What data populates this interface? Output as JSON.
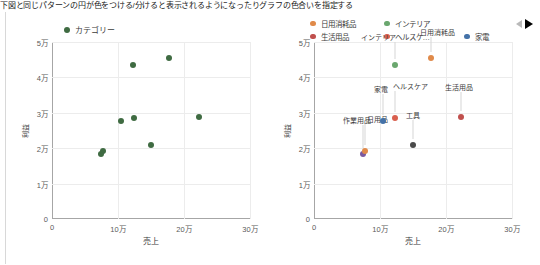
{
  "top_caption": "下図と同じパターンの円が色をつける/分けると表示されるようになったりグラフの色合いを指定する",
  "colors": {
    "series_green": "#3f6b42",
    "orange": "#e08a4a",
    "green": "#6aa76e",
    "red": "#c0504d",
    "red_orange": "#d9604f",
    "blue": "#4472a8",
    "gridline": "#ececec",
    "axis": "#a6a6a6",
    "text": "#3b3b3b"
  },
  "left_chart": {
    "legend": [
      {
        "label": "カテゴリー",
        "color": "#3f6b42",
        "icon": "legend-dot-icon"
      }
    ]
  },
  "right_chart": {
    "legend": [
      {
        "label": "日用消耗品",
        "color": "#e08a4a",
        "icon": "legend-dot-icon"
      },
      {
        "label": "インテリア",
        "color": "#6aa76e",
        "icon": "legend-dot-icon"
      },
      {
        "label": "生活用品",
        "color": "#c0504d",
        "icon": "legend-dot-icon"
      },
      {
        "label": "ヘルスケ…",
        "color": "#d9604f",
        "icon": "legend-dot-icon"
      },
      {
        "label": "家電",
        "color": "#4472a8",
        "icon": "legend-dot-icon"
      }
    ],
    "pager": {
      "prev_icon": "arrow-left-icon",
      "next_icon": "arrow-right-icon"
    }
  },
  "chart_data": [
    {
      "type": "scatter",
      "title": "",
      "xlabel": "売上",
      "ylabel": "利益",
      "xlim": [
        0,
        300000
      ],
      "ylim": [
        0,
        50000
      ],
      "xticks": [
        0,
        100000,
        200000,
        300000
      ],
      "xticklabels": [
        "0",
        "10万",
        "20万",
        "30万"
      ],
      "yticks": [
        0,
        10000,
        20000,
        30000,
        40000,
        50000
      ],
      "yticklabels": [
        "0",
        "1万",
        "2万",
        "3万",
        "4万",
        "5万"
      ],
      "grid": true,
      "legend_position": "top-left",
      "series": [
        {
          "name": "カテゴリー",
          "color": "#3f6b42",
          "points": [
            {
              "x": 74000,
              "y": 18400
            },
            {
              "x": 78000,
              "y": 19200
            },
            {
              "x": 104000,
              "y": 27600
            },
            {
              "x": 122000,
              "y": 43600
            },
            {
              "x": 124000,
              "y": 28400
            },
            {
              "x": 150000,
              "y": 21000
            },
            {
              "x": 178000,
              "y": 45500
            },
            {
              "x": 222000,
              "y": 28700
            }
          ]
        }
      ]
    },
    {
      "type": "scatter",
      "title": "",
      "xlabel": "売上",
      "ylabel": "利益",
      "xlim": [
        0,
        300000
      ],
      "ylim": [
        0,
        50000
      ],
      "xticks": [
        0,
        100000,
        200000,
        300000
      ],
      "xticklabels": [
        "0",
        "10万",
        "20万",
        "30万"
      ],
      "yticks": [
        0,
        10000,
        20000,
        30000,
        40000,
        50000
      ],
      "yticklabels": [
        "0",
        "1万",
        "2万",
        "3万",
        "4万",
        "5万"
      ],
      "grid": true,
      "legend_position": "top",
      "labelled_points": [
        {
          "label": "作業用品",
          "x": 74000,
          "y": 18400,
          "color": "#7b5aa0",
          "label_dx": -6,
          "label_dy": 34
        },
        {
          "label": "日用品",
          "x": 78000,
          "y": 19200,
          "color": "#e08a4a",
          "label_dx": 12,
          "label_dy": 32
        },
        {
          "label": "家電",
          "x": 104000,
          "y": 27600,
          "color": "#4472a8",
          "label_dx": -2,
          "label_dy": 32
        },
        {
          "label": "ヘルスケア",
          "x": 122000,
          "y": 28400,
          "color": "#d9604f",
          "label_dx": 16,
          "label_dy": 32
        },
        {
          "label": "インテリア",
          "x": 122000,
          "y": 43600,
          "color": "#6aa76e",
          "label_dx": -16,
          "label_dy": 28
        },
        {
          "label": "工具",
          "x": 150000,
          "y": 21000,
          "color": "#4a4a4a",
          "label_dx": 0,
          "label_dy": 30
        },
        {
          "label": "日用消耗品",
          "x": 178000,
          "y": 45500,
          "color": "#e08a4a",
          "label_dx": 6,
          "label_dy": 26
        },
        {
          "label": "生活用品",
          "x": 222000,
          "y": 28700,
          "color": "#c0504d",
          "label_dx": -2,
          "label_dy": 30
        }
      ]
    }
  ]
}
